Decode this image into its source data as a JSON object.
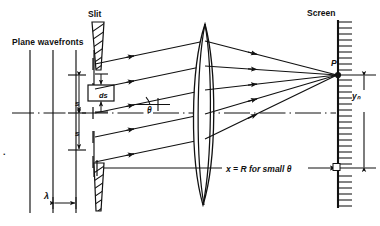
{
  "figure": {
    "width": 380,
    "height": 226,
    "ink_color": "#111111",
    "background_color": "#ffffff"
  },
  "labels": {
    "plane_wavefronts": "Plane wavefronts",
    "slit": "Slit",
    "screen": "Screen",
    "point_p": "P",
    "y_n": "yₙ",
    "ds": "ds",
    "s_upper": "s",
    "s_lower": "s",
    "theta": "θ",
    "lambda": "λ",
    "distance_note": "x = R for small θ",
    "stray_mark": "."
  },
  "geometry": {
    "axis_y": 113,
    "slit_x": 97,
    "lens_x": 205,
    "screen_x": 338,
    "point_p_y": 75,
    "wavefront_xs": [
      30,
      53,
      76,
      94
    ],
    "lambda_dim": {
      "x1": 53,
      "x2": 76,
      "y": 203
    },
    "rays_start_ys": [
      64,
      89,
      113,
      137,
      162
    ],
    "ds_box": {
      "x": 88,
      "y": 85,
      "w": 26,
      "h": 16
    }
  },
  "icons": {
    "slit_block_top": "hatched-slit-block-icon",
    "slit_block_bottom": "hatched-slit-block-icon",
    "screen_hatching": "screen-hatch-icon",
    "lens": "biconvex-lens-icon",
    "optical_axis": "dash-dot-axis-icon",
    "arrowhead": "arrowhead-icon"
  }
}
